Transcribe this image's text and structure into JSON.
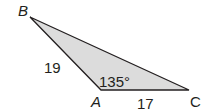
{
  "diagram": {
    "type": "triangle",
    "fill_color": "#dcdcdc",
    "stroke_color": "#231f20",
    "vertices": [
      {
        "label": "B",
        "x": 30,
        "y": 17
      },
      {
        "label": "A",
        "x": 101,
        "y": 90
      },
      {
        "label": "C",
        "x": 189,
        "y": 90
      }
    ],
    "sides": [
      {
        "between": "AB",
        "label": "19"
      },
      {
        "between": "AC",
        "label": "17"
      }
    ],
    "angle": {
      "vertex": "A",
      "label": "135°"
    }
  }
}
